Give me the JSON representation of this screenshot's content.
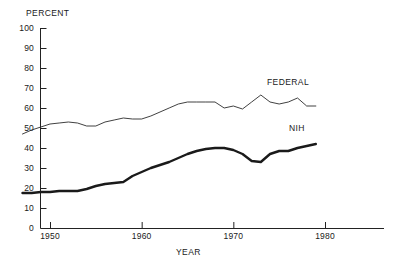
{
  "chart_data": {
    "type": "line",
    "title": "",
    "xlabel": "YEAR",
    "ylabel": "PERCENT",
    "grid": false,
    "legend_position": "inline-right",
    "xlim": [
      1947,
      1980
    ],
    "ylim": [
      0,
      100
    ],
    "yticks": [
      0,
      10,
      20,
      30,
      40,
      50,
      60,
      70,
      80,
      90,
      100
    ],
    "ytick_labels": [
      "0",
      "10",
      "20",
      "30",
      "40",
      "50",
      "60",
      "70",
      "80",
      "90",
      "100"
    ],
    "xticks": [
      1950,
      1960,
      1970,
      1980
    ],
    "xtick_labels": [
      "1950",
      "1960",
      "1970",
      "1980"
    ],
    "x": [
      1947,
      1948,
      1949,
      1950,
      1951,
      1952,
      1953,
      1954,
      1955,
      1956,
      1957,
      1958,
      1959,
      1960,
      1961,
      1962,
      1963,
      1964,
      1965,
      1966,
      1967,
      1968,
      1969,
      1970,
      1971,
      1972,
      1973,
      1974,
      1975,
      1976,
      1977,
      1978,
      1979
    ],
    "series": [
      {
        "name": "FEDERAL",
        "color": "#2b2b2b",
        "line_width": 0.9,
        "values": [
          47,
          49,
          50.5,
          52,
          52.5,
          53,
          52.5,
          51,
          51,
          53,
          54,
          55,
          54.5,
          54.5,
          56,
          58,
          60,
          62,
          63,
          63,
          63,
          63,
          60,
          61,
          59.5,
          63,
          66.5,
          63,
          62,
          63,
          65,
          61,
          61
        ]
      },
      {
        "name": "NIH",
        "color": "#1a1a1a",
        "line_width": 2.4,
        "values": [
          17.5,
          17.5,
          18,
          18,
          18.5,
          18.5,
          18.5,
          19.5,
          21,
          22,
          22.5,
          23,
          26,
          28,
          30,
          31.5,
          33,
          35,
          37,
          38.5,
          39.5,
          40,
          40,
          39,
          37,
          33.5,
          33,
          37,
          38.5,
          38.5,
          40,
          41,
          42
        ]
      }
    ],
    "annotations": [
      {
        "text": "FEDERAL",
        "x": 1978,
        "y": 68
      },
      {
        "text": "NIH",
        "x": 1980,
        "y": 47
      }
    ]
  }
}
